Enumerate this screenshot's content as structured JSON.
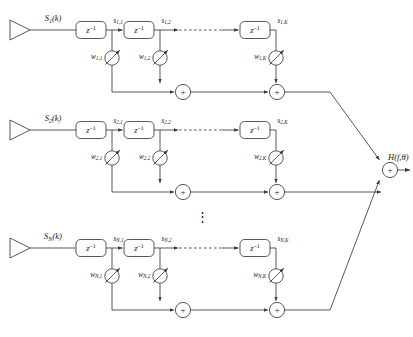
{
  "figure": {
    "output_label": "H(f,θ)",
    "ellipsis_glyph": "⋮",
    "sum_glyph": "+",
    "delay_label": "z",
    "delay_exponent": "–1",
    "stroke_color": "#3a3a3a",
    "text_color": "#1a1a1a",
    "background_color": "#ffffff"
  },
  "rows": [
    {
      "id": "row-1",
      "input_label": "S",
      "input_sub": "1",
      "input_arg": "(k)",
      "taps": [
        {
          "label": "s",
          "sub": "1,1"
        },
        {
          "label": "s",
          "sub": "1,2"
        },
        {
          "label": "s",
          "sub": "1,K"
        }
      ],
      "weights": [
        {
          "label": "w",
          "sub": "1,1"
        },
        {
          "label": "w",
          "sub": "1,2"
        },
        {
          "label": "w",
          "sub": "1,K"
        }
      ]
    },
    {
      "id": "row-2",
      "input_label": "S",
      "input_sub": "2",
      "input_arg": "(k)",
      "taps": [
        {
          "label": "s",
          "sub": "2,1"
        },
        {
          "label": "s",
          "sub": "2,2"
        },
        {
          "label": "s",
          "sub": "2,K"
        }
      ],
      "weights": [
        {
          "label": "w",
          "sub": "2,1"
        },
        {
          "label": "w",
          "sub": "2,2"
        },
        {
          "label": "w",
          "sub": "2,K"
        }
      ]
    },
    {
      "id": "row-N",
      "input_label": "S",
      "input_sub": "N",
      "input_arg": "(k)",
      "taps": [
        {
          "label": "s",
          "sub": "N,1"
        },
        {
          "label": "s",
          "sub": "N,2"
        },
        {
          "label": "s",
          "sub": "N,K"
        }
      ],
      "weights": [
        {
          "label": "w",
          "sub": "N,1"
        },
        {
          "label": "w",
          "sub": "N,2"
        },
        {
          "label": "w",
          "sub": "N,K"
        }
      ]
    }
  ]
}
